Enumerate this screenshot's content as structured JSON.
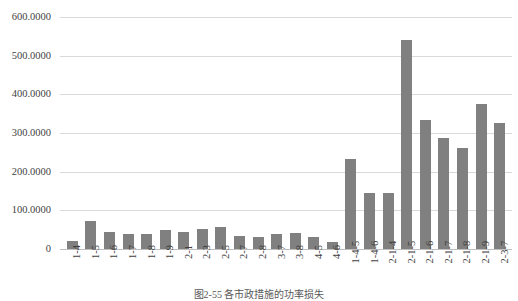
{
  "caption": "图2-55  各市政措施的功率损失",
  "chart_data": {
    "type": "bar",
    "title": "",
    "xlabel": "",
    "ylabel": "",
    "ylim": [
      0,
      600
    ],
    "grid": true,
    "legend": "none",
    "bar_color": "#808080",
    "gridline_color": "#d9d9d9",
    "ytick_labels": [
      "600.0000",
      "500.0000",
      "400.0000",
      "300.0000",
      "200.0000",
      "100.0000",
      "0"
    ],
    "yticks": [
      600,
      500,
      400,
      300,
      200,
      100,
      0
    ],
    "categories": [
      "1-4",
      "1-5",
      "1-6",
      "1-7",
      "1-8",
      "1-9",
      "2-1",
      "2-3",
      "2-5",
      "2-7",
      "2-8",
      "3-7",
      "3-8",
      "4-5",
      "4-6",
      "1-4-5",
      "1-4-6",
      "2-1-4",
      "2-1-5",
      "2-1-6",
      "2-1-7",
      "2-1-8",
      "2-1-9",
      "2-3-7"
    ],
    "values": [
      22,
      72,
      45,
      38,
      40,
      48,
      44,
      52,
      58,
      34,
      30,
      38,
      42,
      30,
      18,
      233,
      145,
      145,
      540,
      333,
      287,
      261,
      375,
      327
    ]
  }
}
